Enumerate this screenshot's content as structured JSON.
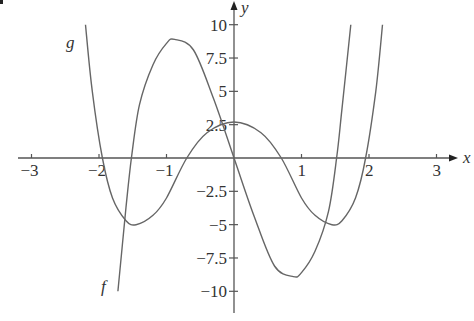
{
  "chart_data": {
    "type": "line",
    "title": "",
    "xlabel": "x",
    "ylabel": "y",
    "xlim": [
      -3.3,
      3.5
    ],
    "ylim": [
      -11.5,
      11.8
    ],
    "grid": false,
    "x_ticks": [
      -3,
      -2,
      -1,
      1,
      2,
      3
    ],
    "x_tick_labels": [
      "−3",
      "−2",
      "−1",
      "1",
      "2",
      "3"
    ],
    "y_ticks": [
      10,
      7.5,
      5,
      2.5,
      -2.5,
      -5,
      -7.5,
      -10
    ],
    "y_tick_labels": [
      "10",
      "7.5",
      "5",
      "2.5",
      "−2.5",
      "−5",
      "−7.5",
      "−10"
    ],
    "series": [
      {
        "name": "f",
        "label": "f",
        "description": "odd cubic-like curve: zeros at about -1.52, 0, 1.52; local max ≈ (-0.88, 8.9); local min ≈ (0.88, -8.9)",
        "x": [
          -1.72,
          -1.6,
          -1.52,
          -1.4,
          -1.2,
          -1.0,
          -0.88,
          -0.6,
          -0.3,
          0,
          0.3,
          0.6,
          0.88,
          1.0,
          1.2,
          1.4,
          1.52,
          1.6,
          1.73
        ],
        "values": [
          -10.0,
          -3.7,
          0,
          4.0,
          7.0,
          8.6,
          8.9,
          8.1,
          4.4,
          0,
          -4.4,
          -8.1,
          -8.9,
          -8.6,
          -7.0,
          -4.0,
          0,
          3.7,
          10.0
        ]
      },
      {
        "name": "g",
        "label": "g",
        "description": "even quartic curve: zeros at about ±1.95, ±0.7; local max ≈ (0, 2.7); local minima ≈ (±1.45, -5)",
        "x": [
          -2.2,
          -2.1,
          -1.95,
          -1.8,
          -1.6,
          -1.45,
          -1.2,
          -1.0,
          -0.7,
          -0.4,
          0,
          0.4,
          0.7,
          1.0,
          1.2,
          1.45,
          1.6,
          1.8,
          1.95,
          2.1,
          2.2
        ],
        "values": [
          10.0,
          5.0,
          0,
          -3.0,
          -4.7,
          -5.0,
          -4.3,
          -3.0,
          0,
          1.9,
          2.7,
          1.9,
          0,
          -3.0,
          -4.3,
          -5.0,
          -4.7,
          -3.0,
          0,
          5.0,
          10.0
        ]
      }
    ],
    "annotations": [
      {
        "text": "g",
        "near": [
          -2.4,
          8.7
        ]
      },
      {
        "text": "f",
        "near": [
          -1.92,
          -9.6
        ]
      }
    ]
  },
  "plot": {
    "x_axis_label": "x",
    "y_axis_label": "y",
    "curve_f_label": "f",
    "curve_g_label": "g"
  }
}
